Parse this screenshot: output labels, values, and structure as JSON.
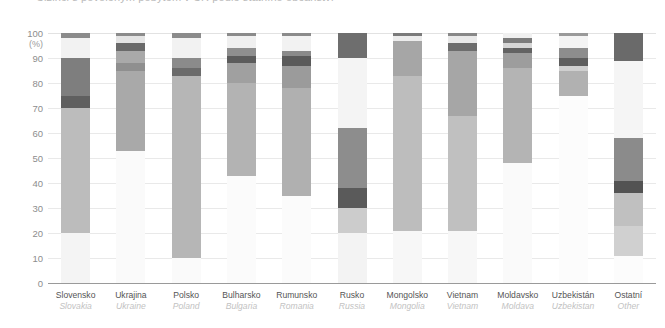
{
  "title": {
    "text": "Cizinci s povoleným pobytem v ČR podle státního občanství"
  },
  "axes": {
    "y_unit": "(%)",
    "y_ticks": [
      "100",
      "90",
      "80",
      "70",
      "60",
      "50",
      "40",
      "30",
      "20",
      "10",
      "0"
    ],
    "y_min": 0,
    "y_max": 100
  },
  "chart_data": {
    "type": "bar",
    "subtype": "stacked-100-percent",
    "title": "Cizinci s povoleným pobytem v ČR podle státního občanství",
    "xlabel": "",
    "ylabel": "(%)",
    "ylim": [
      0,
      100
    ],
    "ytick_labels": [
      "0",
      "10",
      "20",
      "30",
      "40",
      "50",
      "60",
      "70",
      "80",
      "90",
      "100"
    ],
    "grid": true,
    "legend": "none",
    "categories": [
      {
        "cz": "Slovensko",
        "en": "Slovakia"
      },
      {
        "cz": "Ukrajina",
        "en": "Ukraine"
      },
      {
        "cz": "Polsko",
        "en": "Poland"
      },
      {
        "cz": "Bulharsko",
        "en": "Bulgaria"
      },
      {
        "cz": "Rumunsko",
        "en": "Romania"
      },
      {
        "cz": "Rusko",
        "en": "Russia"
      },
      {
        "cz": "Mongolsko",
        "en": "Mongolia"
      },
      {
        "cz": "Vietnam",
        "en": "Vietnam"
      },
      {
        "cz": "Moldavsko",
        "en": "Moldava"
      },
      {
        "cz": "Uzbekistán",
        "en": "Uzbekistan"
      },
      {
        "cz": "Ostatní",
        "en": "Other"
      }
    ],
    "palette": {
      "lightest": "#f7f7f7",
      "very_light": "#ededed",
      "light": "#e0e0e0",
      "light_mid": "#d2d2d2",
      "mid": "#bdbdbd",
      "mid_dark": "#a8a8a8",
      "dark": "#8f8f8f",
      "darker": "#6f6f6f",
      "darkest": "#4f4f4f"
    },
    "bars": [
      {
        "category": "Slovensko",
        "segments": [
          {
            "from": 0,
            "to": 20,
            "color": "#f4f4f4"
          },
          {
            "from": 20,
            "to": 70,
            "color": "#bcbcbc"
          },
          {
            "from": 70,
            "to": 75,
            "color": "#5f5f5f"
          },
          {
            "from": 75,
            "to": 90,
            "color": "#7e7e7e"
          },
          {
            "from": 90,
            "to": 98,
            "color": "#f2f2f2"
          },
          {
            "from": 98,
            "to": 100,
            "color": "#8b8b8b"
          }
        ]
      },
      {
        "category": "Ukrajina",
        "segments": [
          {
            "from": 0,
            "to": 53,
            "color": "#fafafa"
          },
          {
            "from": 53,
            "to": 85,
            "color": "#a9a9a9"
          },
          {
            "from": 85,
            "to": 88,
            "color": "#8f8f8f"
          },
          {
            "from": 88,
            "to": 93,
            "color": "#a9a9a9"
          },
          {
            "from": 93,
            "to": 96,
            "color": "#6a6a6a"
          },
          {
            "from": 96,
            "to": 99,
            "color": "#e4e4e4"
          },
          {
            "from": 99,
            "to": 100,
            "color": "#8b8b8b"
          }
        ]
      },
      {
        "category": "Polsko",
        "segments": [
          {
            "from": 0,
            "to": 10,
            "color": "#fafafa"
          },
          {
            "from": 10,
            "to": 83,
            "color": "#b6b6b6"
          },
          {
            "from": 83,
            "to": 86,
            "color": "#6b6b6b"
          },
          {
            "from": 86,
            "to": 90,
            "color": "#8b8b8b"
          },
          {
            "from": 90,
            "to": 98,
            "color": "#f2f2f2"
          },
          {
            "from": 98,
            "to": 100,
            "color": "#8b8b8b"
          }
        ]
      },
      {
        "category": "Bulharsko",
        "segments": [
          {
            "from": 0,
            "to": 43,
            "color": "#fbfbfb"
          },
          {
            "from": 43,
            "to": 80,
            "color": "#b3b3b3"
          },
          {
            "from": 80,
            "to": 88,
            "color": "#a0a0a0"
          },
          {
            "from": 88,
            "to": 91,
            "color": "#5c5c5c"
          },
          {
            "from": 91,
            "to": 94,
            "color": "#8f8f8f"
          },
          {
            "from": 94,
            "to": 99,
            "color": "#f0f0f0"
          },
          {
            "from": 99,
            "to": 100,
            "color": "#8b8b8b"
          }
        ]
      },
      {
        "category": "Rumunsko",
        "segments": [
          {
            "from": 0,
            "to": 35,
            "color": "#fbfbfb"
          },
          {
            "from": 35,
            "to": 78,
            "color": "#b0b0b0"
          },
          {
            "from": 78,
            "to": 87,
            "color": "#9b9b9b"
          },
          {
            "from": 87,
            "to": 91,
            "color": "#5a5a5a"
          },
          {
            "from": 91,
            "to": 93,
            "color": "#8a8a8a"
          },
          {
            "from": 93,
            "to": 99,
            "color": "#f2f2f2"
          },
          {
            "from": 99,
            "to": 100,
            "color": "#8b8b8b"
          }
        ]
      },
      {
        "category": "Rusko",
        "segments": [
          {
            "from": 0,
            "to": 20,
            "color": "#f3f3f3"
          },
          {
            "from": 20,
            "to": 30,
            "color": "#cccccc"
          },
          {
            "from": 30,
            "to": 38,
            "color": "#5a5a5a"
          },
          {
            "from": 38,
            "to": 62,
            "color": "#8d8d8d"
          },
          {
            "from": 62,
            "to": 90,
            "color": "#f4f4f4"
          },
          {
            "from": 90,
            "to": 100,
            "color": "#6e6e6e"
          }
        ]
      },
      {
        "category": "Mongolsko",
        "segments": [
          {
            "from": 0,
            "to": 21,
            "color": "#f7f7f7"
          },
          {
            "from": 21,
            "to": 83,
            "color": "#bdbdbd"
          },
          {
            "from": 83,
            "to": 97,
            "color": "#a6a6a6"
          },
          {
            "from": 97,
            "to": 99,
            "color": "#ececec"
          },
          {
            "from": 99,
            "to": 100,
            "color": "#7b7b7b"
          }
        ]
      },
      {
        "category": "Vietnam",
        "segments": [
          {
            "from": 0,
            "to": 21,
            "color": "#f7f7f7"
          },
          {
            "from": 21,
            "to": 67,
            "color": "#c0c0c0"
          },
          {
            "from": 67,
            "to": 93,
            "color": "#a6a6a6"
          },
          {
            "from": 93,
            "to": 96,
            "color": "#6d6d6d"
          },
          {
            "from": 96,
            "to": 99,
            "color": "#e9e9e9"
          },
          {
            "from": 99,
            "to": 100,
            "color": "#888888"
          }
        ]
      },
      {
        "category": "Moldavsko",
        "segments": [
          {
            "from": 0,
            "to": 48,
            "color": "#fafafa"
          },
          {
            "from": 48,
            "to": 86,
            "color": "#b4b4b4"
          },
          {
            "from": 86,
            "to": 92,
            "color": "#9d9d9d"
          },
          {
            "from": 92,
            "to": 94,
            "color": "#636363"
          },
          {
            "from": 94,
            "to": 96,
            "color": "#d6d6d6"
          },
          {
            "from": 96,
            "to": 98,
            "color": "#7c7c7c"
          },
          {
            "from": 98,
            "to": 100,
            "color": "#f0f0f0"
          }
        ]
      },
      {
        "category": "Uzbekistán",
        "segments": [
          {
            "from": 0,
            "to": 75,
            "color": "#fcfcfc"
          },
          {
            "from": 75,
            "to": 85,
            "color": "#b1b1b1"
          },
          {
            "from": 85,
            "to": 87,
            "color": "#cfcfcf"
          },
          {
            "from": 87,
            "to": 90,
            "color": "#5e5e5e"
          },
          {
            "from": 90,
            "to": 94,
            "color": "#8d8d8d"
          },
          {
            "from": 94,
            "to": 99,
            "color": "#f4f4f4"
          },
          {
            "from": 99,
            "to": 100,
            "color": "#9a9a9a"
          }
        ]
      },
      {
        "category": "Ostatní",
        "segments": [
          {
            "from": 0,
            "to": 11,
            "color": "#fcfcfc"
          },
          {
            "from": 11,
            "to": 23,
            "color": "#d0d0d0"
          },
          {
            "from": 23,
            "to": 36,
            "color": "#c0c0c0"
          },
          {
            "from": 36,
            "to": 41,
            "color": "#535353"
          },
          {
            "from": 41,
            "to": 58,
            "color": "#8b8b8b"
          },
          {
            "from": 58,
            "to": 89,
            "color": "#f5f5f5"
          },
          {
            "from": 89,
            "to": 100,
            "color": "#6a6a6a"
          }
        ]
      }
    ]
  }
}
